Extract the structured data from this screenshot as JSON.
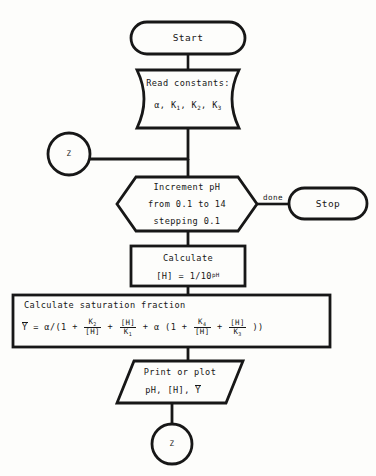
{
  "diagram": {
    "background_color": "#fdfdfb",
    "ink_color": "#171717"
  },
  "nodes": {
    "start": {
      "label": "Start",
      "shape": "terminator"
    },
    "read_constants": {
      "line1": "Read constants:",
      "line2_alpha": "α,",
      "line2_k1": "K",
      "line2_k1_sub": "1",
      "line2_k2": "K",
      "line2_k2_sub": "2",
      "line2_k3": "K",
      "line2_k3_sub": "3",
      "shape": "curved-sides"
    },
    "connector_top": {
      "label": "Z",
      "shape": "circle"
    },
    "loop": {
      "line1": "Increment pH",
      "line2": "from 0.1 to 14",
      "line3": "stepping 0.1",
      "shape": "hexagon"
    },
    "done_label": "done",
    "stop": {
      "label": "Stop",
      "shape": "terminator"
    },
    "calc_h": {
      "line1": "Calculate",
      "line2_pre": "[H] = 1/10",
      "line2_exp": "pH",
      "shape": "rectangle"
    },
    "calc_saturation": {
      "heading": "Calculate saturation fraction",
      "formula_plain": "Y = α/(1 + K2/[H] + [H]/K1 + α (1 + K4/[H] + [H]/K3 ))",
      "y_var": "Y",
      "eq": "=",
      "alpha": "α/(1 +",
      "f1_num": "K",
      "f1_num_sub": "2",
      "f1_den": "[H]",
      "plus1": "+",
      "f2_num": "[H]",
      "f2_den": "K",
      "f2_den_sub": "1",
      "plus2": "+",
      "alpha2": "α (1 +",
      "f3_num": "K",
      "f3_num_sub": "4",
      "f3_den": "[H]",
      "plus3": "+",
      "f4_num": "[H]",
      "f4_den": "K",
      "f4_den_sub": "3",
      "close": "))",
      "shape": "rectangle"
    },
    "output": {
      "line1": "Print or plot",
      "line2_ph": "pH, [H],",
      "line2_y": "Y",
      "shape": "parallelogram"
    },
    "connector_bottom": {
      "label": "Z",
      "shape": "circle"
    }
  }
}
